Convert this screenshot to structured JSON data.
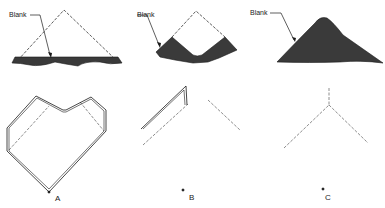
{
  "figure": {
    "panels": [
      {
        "id": "A",
        "caption": "A",
        "callout": "Blank",
        "blank_shape": "triangle-with-strip"
      },
      {
        "id": "B",
        "caption": "B",
        "callout": "Blank",
        "blank_shape": "notched-v"
      },
      {
        "id": "C",
        "caption": "C",
        "callout": "Blank",
        "blank_shape": "rounded-mound"
      }
    ]
  },
  "colors": {
    "line": "#1a1a1a",
    "fill": "#3a3a3a",
    "background": "#ffffff"
  }
}
